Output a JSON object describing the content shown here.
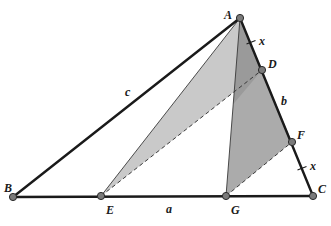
{
  "figure": {
    "type": "geometry-diagram",
    "colors": {
      "background": "#ffffff",
      "edge": "#1a1a1a",
      "shade_light": "#c9c9c9",
      "shade_medium": "#ababab",
      "shade_dark": "#9a9a9a",
      "point_fill": "#7a7a7a"
    },
    "points": {
      "A": {
        "label": "A",
        "x": 240,
        "y": 18
      },
      "B": {
        "label": "B",
        "x": 13,
        "y": 197
      },
      "C": {
        "label": "C",
        "x": 313,
        "y": 196
      },
      "D": {
        "label": "D",
        "x": 262,
        "y": 70
      },
      "E": {
        "label": "E",
        "x": 101,
        "y": 196
      },
      "F": {
        "label": "F",
        "x": 292,
        "y": 142
      },
      "G": {
        "label": "G",
        "x": 226,
        "y": 196
      }
    },
    "side_labels": {
      "a": "a",
      "b": "b",
      "c": "c"
    },
    "segment_marks": {
      "AD": "x",
      "FC": "x"
    },
    "segments": [
      {
        "from": "A",
        "to": "B",
        "style": "thick",
        "label": "c"
      },
      {
        "from": "B",
        "to": "C",
        "style": "thick",
        "label": "a"
      },
      {
        "from": "A",
        "to": "C",
        "style": "thick",
        "label": "b"
      },
      {
        "from": "A",
        "to": "E",
        "style": "thin"
      },
      {
        "from": "A",
        "to": "G",
        "style": "thin"
      },
      {
        "from": "E",
        "to": "D",
        "style": "dashed"
      },
      {
        "from": "G",
        "to": "F",
        "style": "dashed"
      }
    ],
    "shaded_regions": [
      {
        "name": "triangle-AED",
        "vertices": [
          "A",
          "E",
          "D"
        ],
        "shade": "light"
      },
      {
        "name": "triangle-AGF",
        "vertices": [
          "A",
          "G",
          "F"
        ],
        "shade": "medium"
      }
    ]
  }
}
